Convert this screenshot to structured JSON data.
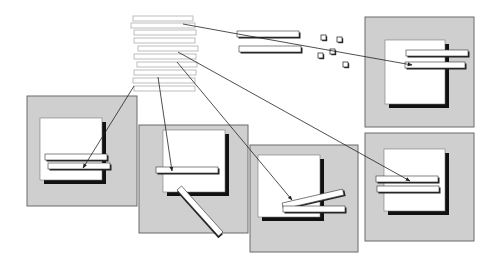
{
  "diagram": {
    "type": "window-placement-illustration",
    "colors": {
      "background": "#ffffff",
      "panel_fill": "#cfcfcf",
      "panel_border": "#6a6a6a",
      "window_fill": "#ffffff",
      "window_shadow": "#111111",
      "bar_fill": "#ffffff",
      "bar_border": "#333333",
      "stack_bar_border": "#bdbdbd",
      "line": "#222222"
    },
    "stack_bars": [
      {
        "x": 133,
        "y": 16,
        "w": 60,
        "h": 5
      },
      {
        "x": 131,
        "y": 23,
        "w": 64,
        "h": 5
      },
      {
        "x": 134,
        "y": 30,
        "w": 62,
        "h": 5
      },
      {
        "x": 134,
        "y": 38,
        "w": 61,
        "h": 5
      },
      {
        "x": 138,
        "y": 46,
        "w": 60,
        "h": 5
      },
      {
        "x": 134,
        "y": 54,
        "w": 62,
        "h": 5
      },
      {
        "x": 137,
        "y": 62,
        "w": 60,
        "h": 5
      },
      {
        "x": 134,
        "y": 70,
        "w": 62,
        "h": 5
      },
      {
        "x": 133,
        "y": 78,
        "w": 62,
        "h": 5
      },
      {
        "x": 134,
        "y": 86,
        "w": 61,
        "h": 5
      }
    ],
    "floating_bars": [
      {
        "x": 237,
        "y": 31,
        "w": 62,
        "h": 6
      },
      {
        "x": 239,
        "y": 46,
        "w": 62,
        "h": 6
      }
    ],
    "small_squares": [
      {
        "x": 321,
        "y": 35
      },
      {
        "x": 337,
        "y": 37
      },
      {
        "x": 330,
        "y": 49
      },
      {
        "x": 318,
        "y": 53
      },
      {
        "x": 343,
        "y": 62
      }
    ],
    "panels": [
      {
        "id": "top-right",
        "x": 365,
        "y": 17,
        "w": 109,
        "h": 110,
        "window": {
          "x": 385,
          "y": 40,
          "w": 60,
          "h": 64
        },
        "bars": [
          {
            "x": 406,
            "y": 50,
            "w": 62,
            "h": 6,
            "angle": 0
          },
          {
            "x": 405,
            "y": 62,
            "w": 60,
            "h": 6,
            "angle": 0
          }
        ]
      },
      {
        "id": "left",
        "x": 27,
        "y": 96,
        "w": 110,
        "h": 110,
        "window": {
          "x": 40,
          "y": 118,
          "w": 62,
          "h": 62
        },
        "bars": [
          {
            "x": 45,
            "y": 154,
            "w": 62,
            "h": 6,
            "angle": 0
          },
          {
            "x": 48,
            "y": 163,
            "w": 62,
            "h": 6,
            "angle": 0
          }
        ]
      },
      {
        "id": "center-left",
        "x": 139,
        "y": 125,
        "w": 109,
        "h": 108,
        "window": {
          "x": 163,
          "y": 130,
          "w": 62,
          "h": 62
        },
        "bars": [
          {
            "x": 156,
            "y": 167,
            "w": 62,
            "h": 6,
            "angle": 0
          },
          {
            "x": 169,
            "y": 208,
            "w": 62,
            "h": 6,
            "angle": 48
          }
        ]
      },
      {
        "id": "center-right",
        "x": 250,
        "y": 145,
        "w": 108,
        "h": 107,
        "window": {
          "x": 258,
          "y": 155,
          "w": 62,
          "h": 62
        },
        "bars": [
          {
            "x": 282,
            "y": 196,
            "w": 62,
            "h": 6,
            "angle": -13
          },
          {
            "x": 283,
            "y": 206,
            "w": 62,
            "h": 6,
            "angle": 0
          }
        ]
      },
      {
        "id": "bottom-right",
        "x": 365,
        "y": 133,
        "w": 109,
        "h": 108,
        "window": {
          "x": 384,
          "y": 149,
          "w": 61,
          "h": 62
        },
        "bars": [
          {
            "x": 376,
            "y": 176,
            "w": 62,
            "h": 6,
            "angle": 0
          },
          {
            "x": 377,
            "y": 186,
            "w": 62,
            "h": 6,
            "angle": 0
          }
        ]
      }
    ],
    "arrows": [
      {
        "from": [
          183,
          24
        ],
        "via": [
          238,
          34
        ],
        "to": [
          412,
          65
        ]
      },
      {
        "from": [
          178,
          52
        ],
        "to": [
          410,
          181
        ]
      },
      {
        "from": [
          177,
          62
        ],
        "to": [
          292,
          200
        ]
      },
      {
        "from": [
          158,
          77
        ],
        "to": [
          172,
          171
        ]
      },
      {
        "from": [
          134,
          86
        ],
        "to": [
          83,
          168
        ]
      }
    ]
  }
}
